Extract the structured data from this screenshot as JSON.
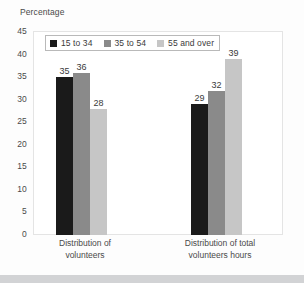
{
  "chart_data": {
    "type": "bar",
    "title": "Percentage",
    "xlabel": "",
    "ylabel": "",
    "ylim": [
      0,
      45
    ],
    "yticks": [
      45,
      40,
      35,
      30,
      25,
      20,
      15,
      10,
      5,
      0
    ],
    "grid": false,
    "legend_position": "top-left-inside",
    "categories": [
      "Distribution of volunteers",
      "Distribution of total volunteers hours"
    ],
    "category_lines": [
      [
        "Distribution of",
        "volunteers"
      ],
      [
        "Distribution of total",
        "volunteers hours"
      ]
    ],
    "series": [
      {
        "name": "15 to 34",
        "color": "#1a1a1a",
        "values": [
          35,
          29
        ]
      },
      {
        "name": "35 to 54",
        "color": "#8a8a8a",
        "values": [
          36,
          32
        ]
      },
      {
        "name": "55 and over",
        "color": "#c6c6c6",
        "values": [
          28,
          39
        ]
      }
    ]
  },
  "colors": {
    "background": "#fdfdfd",
    "plot_background": "#ffffff",
    "frame": "#e4e4e4",
    "text": "#3a3a3a",
    "bottom_band": "#d2d3d5"
  }
}
